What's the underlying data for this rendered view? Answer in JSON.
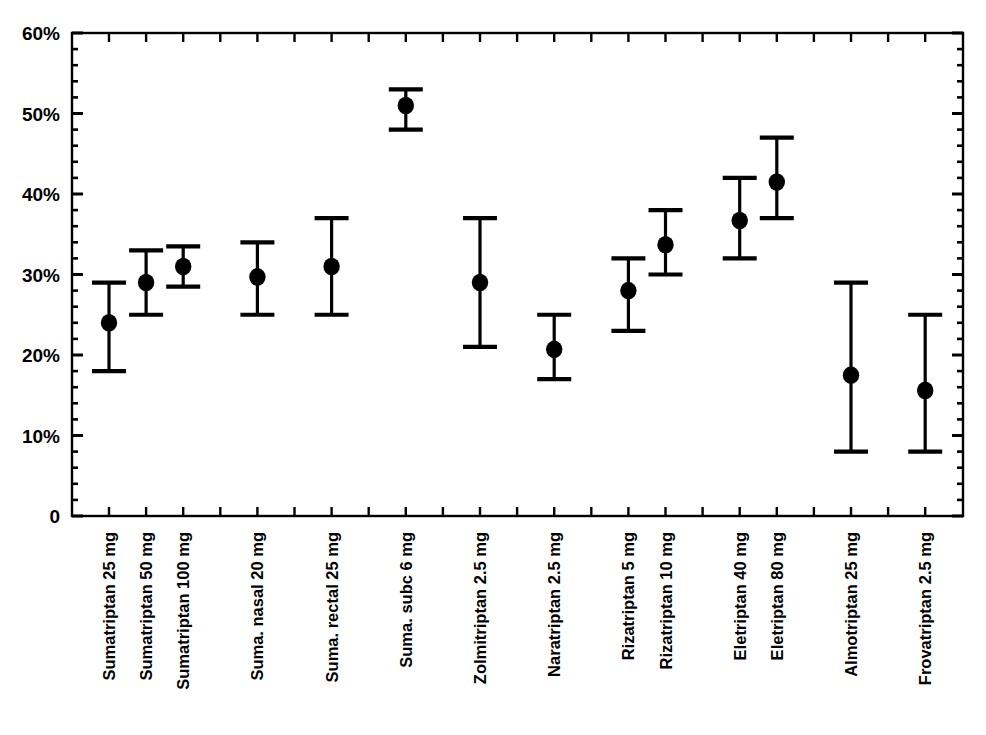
{
  "chart_data": {
    "type": "scatter",
    "title": "",
    "subtitle": "",
    "xlabel": "",
    "ylabel": "",
    "ylim": [
      0,
      60
    ],
    "yunit": "%",
    "grid": false,
    "legend": null,
    "ytick_labels": [
      "0",
      "10%",
      "20%",
      "30%",
      "40%",
      "50%",
      "60%"
    ],
    "ytick_values": [
      0,
      10,
      20,
      30,
      40,
      50,
      60
    ],
    "yminor_step": 2,
    "error_bar_style": "capped-vertical",
    "marker": "filled-circle",
    "categories": [
      "Sumatriptan 25 mg",
      "Sumatriptan 50 mg",
      "Sumatriptan 100 mg",
      "Suma. nasal 20 mg",
      "Suma. rectal 25 mg",
      "Suma. subc 6 mg",
      "Zolmitriptan 2.5 mg",
      "Naratriptan 2.5 mg",
      "Rizatriptan 5 mg",
      "Rizatriptan 10 mg",
      "Eletriptan 40 mg",
      "Eletriptan 80 mg",
      "Almotriptan 25 mg",
      "Frovatriptan 2.5 mg"
    ],
    "slots": [
      1,
      2,
      3,
      5,
      7,
      9,
      11,
      13,
      15,
      16,
      18,
      19,
      21,
      23
    ],
    "slot_count": 24,
    "values": [
      24,
      29,
      31,
      29.7,
      31,
      51,
      29,
      20.7,
      28,
      33.7,
      36.7,
      41.5,
      17.5,
      15.6
    ],
    "ci_low": [
      18,
      25,
      28.5,
      25,
      25,
      48,
      21,
      17,
      23,
      30,
      32,
      37,
      8,
      8
    ],
    "ci_high": [
      29,
      33,
      33.5,
      34,
      37,
      53,
      37,
      25,
      32,
      38,
      42,
      47,
      29,
      25
    ],
    "points": [
      {
        "label": "Sumatriptan 25 mg",
        "value": 24,
        "low": 18,
        "high": 29
      },
      {
        "label": "Sumatriptan 50 mg",
        "value": 29,
        "low": 25,
        "high": 33
      },
      {
        "label": "Sumatriptan 100 mg",
        "value": 31,
        "low": 28.5,
        "high": 33.5
      },
      {
        "label": "Suma. nasal 20 mg",
        "value": 29.7,
        "low": 25,
        "high": 34
      },
      {
        "label": "Suma. rectal 25 mg",
        "value": 31,
        "low": 25,
        "high": 37
      },
      {
        "label": "Suma. subc 6 mg",
        "value": 51,
        "low": 48,
        "high": 53
      },
      {
        "label": "Zolmitriptan 2.5 mg",
        "value": 29,
        "low": 21,
        "high": 37
      },
      {
        "label": "Naratriptan 2.5 mg",
        "value": 20.7,
        "low": 17,
        "high": 25
      },
      {
        "label": "Rizatriptan 5 mg",
        "value": 28,
        "low": 23,
        "high": 32
      },
      {
        "label": "Rizatriptan 10 mg",
        "value": 33.7,
        "low": 30,
        "high": 38
      },
      {
        "label": "Eletriptan 40 mg",
        "value": 36.7,
        "low": 32,
        "high": 42
      },
      {
        "label": "Eletriptan 80 mg",
        "value": 41.5,
        "low": 37,
        "high": 47
      },
      {
        "label": "Almotriptan 25 mg",
        "value": 17.5,
        "low": 8,
        "high": 29
      },
      {
        "label": "Frovatriptan 2.5 mg",
        "value": 15.6,
        "low": 8,
        "high": 25
      }
    ],
    "colors": {
      "axis": "#000000",
      "marker": "#000000",
      "errorbar": "#000000",
      "background": "#ffffff",
      "text": "#000000"
    }
  }
}
